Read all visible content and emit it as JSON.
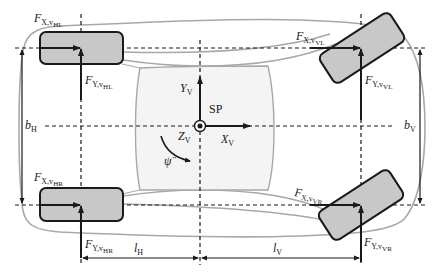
{
  "diagram": {
    "colors": {
      "body_outline": "#a8a8a8",
      "cabin_fill": "#f4f4f4",
      "tire_fill": "#c8c8c8",
      "tire_stroke": "#1a1a1a",
      "line": "#1a1a1a"
    },
    "labels": {
      "fx_hl": {
        "main": "F",
        "sub1": "X,v",
        "sub2": "HL"
      },
      "fy_hl": {
        "main": "F",
        "sub1": "Y,v",
        "sub2": "HL"
      },
      "fx_vl": {
        "main": "F",
        "sub1": "X,v",
        "sub2": "VL"
      },
      "fy_vl": {
        "main": "F",
        "sub1": "Y,v",
        "sub2": "VL"
      },
      "fx_hr": {
        "main": "F",
        "sub1": "X,v",
        "sub2": "HR"
      },
      "fy_hr": {
        "main": "F",
        "sub1": "Y,v",
        "sub2": "HR"
      },
      "fx_vr": {
        "main": "F",
        "sub1": "X,v",
        "sub2": "VR"
      },
      "fy_vr": {
        "main": "F",
        "sub1": "Y,v",
        "sub2": "VR"
      },
      "yv": {
        "main": "Y",
        "sub": "V"
      },
      "xv": {
        "main": "X",
        "sub": "V"
      },
      "zv": {
        "main": "Z",
        "sub": "V"
      },
      "sp": "SP",
      "psi": "ψ̈",
      "bh": {
        "main": "b",
        "sub": "H"
      },
      "bv": {
        "main": "b",
        "sub": "V"
      },
      "lh": {
        "main": "l",
        "sub": "H"
      },
      "lv": {
        "main": "l",
        "sub": "V"
      }
    },
    "wheels": [
      {
        "id": "HL",
        "position": "rear-left",
        "steer_angle_deg": 0
      },
      {
        "id": "HR",
        "position": "rear-right",
        "steer_angle_deg": 0
      },
      {
        "id": "VL",
        "position": "front-left",
        "steer_angle_deg": -35
      },
      {
        "id": "VR",
        "position": "front-right",
        "steer_angle_deg": -35
      }
    ]
  }
}
